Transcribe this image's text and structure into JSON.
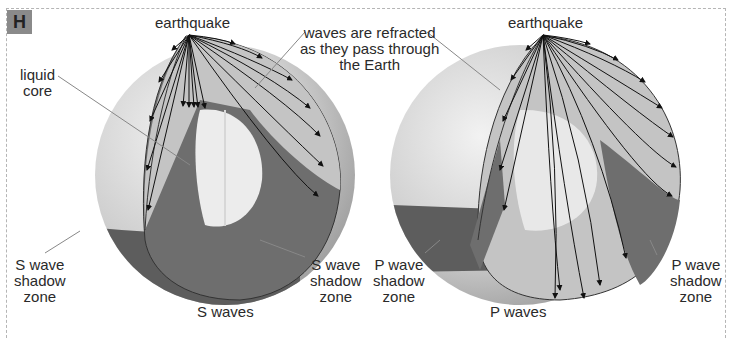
{
  "figure": {
    "badge": "H",
    "labels": {
      "earthquake_left": "earthquake",
      "earthquake_right": "earthquake",
      "refracted_line1": "waves are refracted",
      "refracted_line2": "as they pass through",
      "refracted_line3": "the Earth",
      "liquid_core_line1": "liquid",
      "liquid_core_line2": "core",
      "s_shadow_left": [
        "S wave",
        "shadow",
        "zone"
      ],
      "s_shadow_right": [
        "S wave",
        "shadow",
        "zone"
      ],
      "p_shadow_left": [
        "P wave",
        "shadow",
        "zone"
      ],
      "p_shadow_right": [
        "P wave",
        "shadow",
        "zone"
      ],
      "s_caption": "S waves",
      "p_caption": "P waves"
    },
    "colors": {
      "badge": "#8a8a8a",
      "mantle": "#a9a9a9",
      "wave_zone": "#c6c6c6",
      "shadow_zone": "#707070",
      "core": "#eeeeee",
      "globe_land": "#d9d9d9",
      "globe_dark": "#5f5f5f",
      "frame": "#b5b5b5"
    }
  }
}
